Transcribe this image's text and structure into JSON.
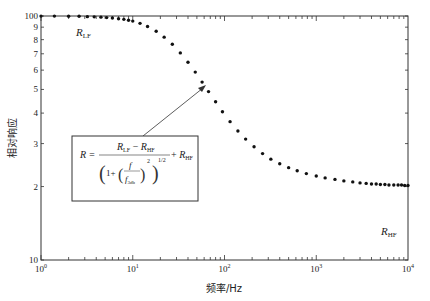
{
  "chart_data": {
    "type": "scatter",
    "title": "",
    "xlabel": "频率/Hz",
    "ylabel": "相对响应",
    "xscale": "log",
    "yscale": "log",
    "xlim": [
      1,
      10000
    ],
    "ylim": [
      10,
      100
    ],
    "grid": false,
    "x_tick_labels": [
      "10^0",
      "10^1",
      "10^2",
      "10^3",
      "10^4"
    ],
    "y_tick_labels": [
      "10",
      "2",
      "3",
      "4",
      "5",
      "6",
      "7",
      "8",
      "9",
      "100"
    ],
    "y_tick_values": [
      10,
      20,
      30,
      40,
      50,
      60,
      70,
      80,
      90,
      100
    ],
    "model": {
      "formula": "R = (R_LF - R_HF) / (1 + (f/f_3db)^2)^(1/2) + R_HF",
      "R_LF": 100,
      "R_HF": 20,
      "f_3db": 27
    },
    "series": [
      {
        "name": "measured response",
        "x": [
          1,
          1.4,
          2,
          2.6,
          3.2,
          3.8,
          4.5,
          5.2,
          6,
          7,
          8,
          9,
          10,
          12,
          14.5,
          18,
          22,
          27,
          33,
          40,
          48,
          57,
          67,
          80,
          95,
          115,
          140,
          170,
          210,
          260,
          320,
          400,
          500,
          620,
          780,
          1000,
          1250,
          1600,
          2000,
          2500,
          3000,
          3500,
          4000,
          4500,
          5000,
          5600,
          6200,
          7000,
          7800,
          8500,
          9200,
          10000
        ],
        "y": [
          99.9,
          99.9,
          99.8,
          99.7,
          99.4,
          99.2,
          98.9,
          98.5,
          98.1,
          97.5,
          96.9,
          96.1,
          95.3,
          93.3,
          90.6,
          86.6,
          81.9,
          76.6,
          70.6,
          64.6,
          58.9,
          53.6,
          49.0,
          44.5,
          40.5,
          36.9,
          33.8,
          31.3,
          29.1,
          27.3,
          25.9,
          24.8,
          23.9,
          23.2,
          22.6,
          22.1,
          21.7,
          21.4,
          21.1,
          20.9,
          20.7,
          20.6,
          20.5,
          20.5,
          20.4,
          20.4,
          20.3,
          20.3,
          20.3,
          20.3,
          20.2,
          20.2
        ]
      }
    ],
    "annotations": [
      {
        "text": "R_LF",
        "position": "upper-left plateau",
        "x": 1.6,
        "y": 85
      },
      {
        "text": "R_HF",
        "position": "lower-right plateau",
        "x": 4000,
        "y": 17.5
      },
      {
        "text": "formula box",
        "arrow_to": {
          "x": 64,
          "y": 53
        }
      }
    ]
  },
  "labels": {
    "xlabel": "频率/Hz",
    "ylabel": "相对响应",
    "r_lf_main": "R",
    "r_lf_sub": "LF",
    "r_hf_main": "R",
    "r_hf_sub": "HF"
  },
  "formula": {
    "lhs": "R =",
    "num_main_1": "R",
    "num_sub_1": "LF",
    "num_minus": " − ",
    "num_main_2": "R",
    "num_sub_2": "HF",
    "den_one_plus": "1+",
    "frac_num": "f",
    "frac_den_main": "f",
    "frac_den_sub": "3db",
    "power_2": "2",
    "power_half": "1/2",
    "plus": "+ ",
    "tail_main": "R",
    "tail_sub": "HF"
  }
}
